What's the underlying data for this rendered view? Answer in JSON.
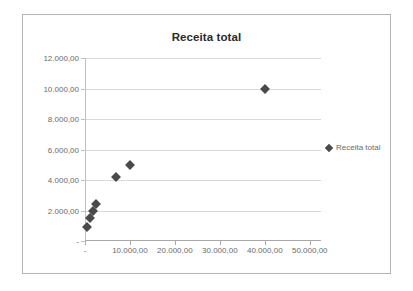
{
  "chart_data": {
    "type": "scatter",
    "title": "Receita total",
    "xlabel": "",
    "ylabel": "",
    "grid": true,
    "legend_position": "right",
    "marker_color": "#4a4a4a",
    "gridline_color": "#d9d9d9",
    "axis_color": "#aaaaaa",
    "label_color": "#6b6b6b",
    "series": [
      {
        "name": "Receita total",
        "points": [
          {
            "x": 500,
            "y": 900
          },
          {
            "x": 1200,
            "y": 1500
          },
          {
            "x": 1800,
            "y": 1950
          },
          {
            "x": 2400,
            "y": 2450
          },
          {
            "x": 7000,
            "y": 4200
          },
          {
            "x": 10000,
            "y": 5000
          },
          {
            "x": 40000,
            "y": 10000
          }
        ]
      }
    ],
    "xlim": [
      0,
      52500
    ],
    "ylim": [
      0,
      12000
    ],
    "x_ticks": [
      {
        "value": 0,
        "label": "-"
      },
      {
        "value": 10000,
        "label": "10.000,00"
      },
      {
        "value": 20000,
        "label": "20.000,00"
      },
      {
        "value": 30000,
        "label": "30.000,00"
      },
      {
        "value": 40000,
        "label": "40.000,00"
      },
      {
        "value": 50000,
        "label": "50.000,00"
      }
    ],
    "y_ticks": [
      {
        "value": 0,
        "label": "-"
      },
      {
        "value": 2000,
        "label": "2.000,00"
      },
      {
        "value": 4000,
        "label": "4.000,00"
      },
      {
        "value": 6000,
        "label": "6.000,00"
      },
      {
        "value": 8000,
        "label": "8.000,00"
      },
      {
        "value": 10000,
        "label": "10.000,00"
      },
      {
        "value": 12000,
        "label": "12.000,00"
      }
    ],
    "legend_entries": [
      {
        "label": "Receita total",
        "marker": "diamond",
        "color": "#4a4a4a"
      }
    ]
  }
}
